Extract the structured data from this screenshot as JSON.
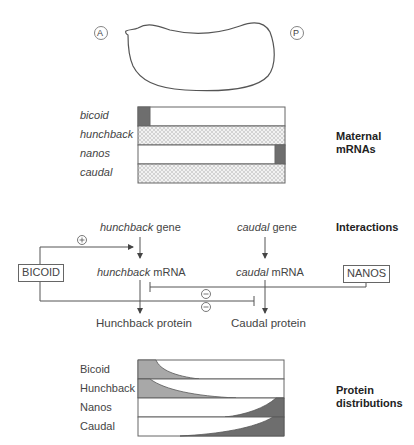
{
  "embryo": {
    "anterior_label": "A",
    "posterior_label": "P"
  },
  "maternal_mrnas": {
    "section_title_line1": "Maternal",
    "section_title_line2": "mRNAs",
    "rows": [
      {
        "label": "bicoid",
        "pattern": "dark-anterior"
      },
      {
        "label": "hunchback",
        "pattern": "uniform-hatched"
      },
      {
        "label": "nanos",
        "pattern": "dark-posterior"
      },
      {
        "label": "caudal",
        "pattern": "uniform-hatched"
      }
    ]
  },
  "interactions": {
    "section_title": "Interactions",
    "hunchback_gene_italic": "hunchback",
    "hunchback_gene_suffix": " gene",
    "caudal_gene_italic": "caudal",
    "caudal_gene_suffix": " gene",
    "hunchback_mrna_italic": "hunchback",
    "hunchback_mrna_suffix": " mRNA",
    "caudal_mrna_italic": "caudal",
    "caudal_mrna_suffix": " mRNA",
    "hunchback_protein": "Hunchback protein",
    "caudal_protein": "Caudal protein",
    "bicoid_box": "BICOID",
    "nanos_box": "NANOS",
    "activation_symbol": "+",
    "repression_symbol_1": "−",
    "repression_symbol_2": "−"
  },
  "protein_distributions": {
    "section_title_line1": "Protein",
    "section_title_line2": "distributions",
    "rows": [
      {
        "label": "Bicoid",
        "gradient": "anterior-high",
        "color": "#aaaaaa"
      },
      {
        "label": "Hunchback",
        "gradient": "anterior-high",
        "color": "#aaaaaa"
      },
      {
        "label": "Nanos",
        "gradient": "posterior-high",
        "color": "#777777"
      },
      {
        "label": "Caudal",
        "gradient": "posterior-high",
        "color": "#777777"
      }
    ]
  },
  "colors": {
    "line": "#555555",
    "dark_fill": "#6e6e6e",
    "light_fill": "#a8a8a8"
  }
}
